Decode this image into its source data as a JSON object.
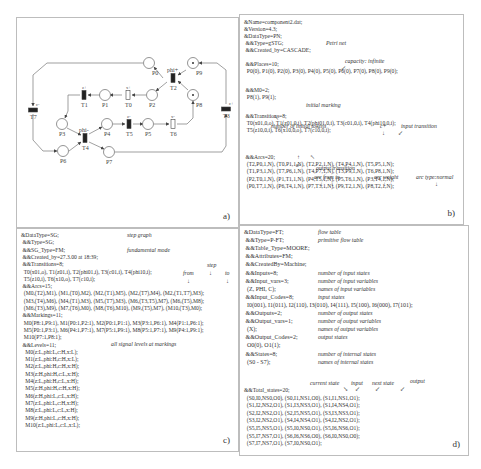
{
  "panels": {
    "a": {
      "label": "a)",
      "places": [
        {
          "id": "P0",
          "tokens": 0
        },
        {
          "id": "P1",
          "tokens": 0
        },
        {
          "id": "P2",
          "tokens": 0
        },
        {
          "id": "P3",
          "tokens": 0
        },
        {
          "id": "P4",
          "tokens": 0
        },
        {
          "id": "P5",
          "tokens": 0
        },
        {
          "id": "P6",
          "tokens": 0
        },
        {
          "id": "P7",
          "tokens": 0
        },
        {
          "id": "P8",
          "tokens": 1
        },
        {
          "id": "P9",
          "tokens": 1
        }
      ],
      "transitions": [
        {
          "id": "T0",
          "signal": "x+",
          "kind": "output"
        },
        {
          "id": "T1",
          "signal": "z+",
          "kind": "input"
        },
        {
          "id": "T2",
          "signal": "phi+",
          "kind": "input"
        },
        {
          "id": "T3",
          "signal": "c+",
          "kind": "input"
        },
        {
          "id": "T4",
          "signal": "phi-",
          "kind": "input"
        },
        {
          "id": "T5",
          "signal": "z-",
          "kind": "input"
        },
        {
          "id": "T6",
          "signal": "x-",
          "kind": "output"
        },
        {
          "id": "T7",
          "signal": "c-",
          "kind": "input"
        }
      ]
    },
    "b": {
      "label": "b)",
      "lines": [
        "&Name=component2.dat;",
        "&Version=4.3;",
        "&DataType=PN;",
        " &&Type=gSTG;",
        " &&Created_by=CASCADE;",
        " &&Places=10;",
        "  P0(0), P1(0), P2(0), P3(0), P4(0), P5(0), P6(0), P7(0), P8(0), P9(0);",
        " &&M0=2;",
        "  P8(1), P9(1);",
        " &&Transitions=8;",
        "  T0(x01,0,o), T1(z01,0,i), T2(phi01,0,i), T3(c01,0,i), T4(phi10,0,i);",
        "  T5(z10,0,i), T6(x10,0,o), T7(c10,0,i);",
        " &&Arcs=20;",
        "  (T2,P0,1,N), (T0,P1,1,N), (T2,P2,1,N), (T4,P4,1,N), (T5,P5,1,N);",
        "  (T1,P3,1,N), (T7,P6,1,N), (T4,P7,1,N), (T3,P9,1,N), (T6,P8,1,N);",
        "  (P2,T0,1,N), (P1,T1,1,N), (P4,T5,1,N), (P5,T6,1,N), (P3,T4,1,N);",
        "  (P0,T7,1,N), (P6,T4,1,N), (P7,T3,1,N), (P9,T2,1,N), (P8,T2,1,N);"
      ],
      "annotations": {
        "petri_net": "Petri net",
        "capacity": "capacity: infinite",
        "initial_marking": "initial marking",
        "initial_tokens": "number of initial tokens",
        "c_plus": "c+",
        "input_transition": "input transition",
        "x_minus": "x-",
        "output_transition": "output transition",
        "arc_from_to": "arc from to",
        "arc_weight": "arc weight",
        "arc_type": "arc type:normal"
      }
    },
    "c": {
      "label": "c)",
      "lines": [
        "&DataType=SG;",
        " &&Type=SG;",
        " &&SG_Type=FM;",
        " &&Created_by=27.3.00 at 18:39;",
        " &&Transitions=8;",
        "  T0(x01,o), T1(z01,i), T2(phi01,i), T3(c01,i), T4(phi10,i);",
        "  T5(z10,i), T6(x10,o), T7(c10,i);",
        " &&Arcs=15;",
        "  (M0,(T2),M1), (M1,(T0),M2), (M2,(T1),M5), (M2,(T7),M4), (M2,(T1,T7),M3);",
        "  (M3,(T4),M6), (M4,(T1),M3), (M5,(T7),M3), (M6,(T3,T5),M7), (M6,(T5),M8);",
        "  (M6,(T3),M9), (M7,(T6),M0), (M8,(T6),M10), (M9,(T5),M7), (M10,(T3),M0);",
        " &&Markings=11;",
        "  M0(P8:1,P9:1), M1(P0:1,P2:1), M2(P0:1,P1:1), M3(P3:1,P6:1), M4(P1:1,P6:1);",
        "  M5(P0:1,P3:1), M6(P4:1,P7:1), M7(P5:1,P9:1), M8(P5:1,P7:1), M9(P4:1,P9:1);",
        "  M10(P7:1,P8:1);",
        " &&Levels=11;",
        "   M0(z:L,phi:L,c:H,x:L);",
        "   M1(z:L,phi:H,c:H,x:L);",
        "   M2(z:L,phi:H,c:H,x:H);",
        "   M3(z:H,phi:H,c:L,x:H);",
        "   M4(z:L,phi:H,c:L,x:H);",
        "   M5(z:H,phi:H,c:H,x:H);",
        "   M6(z:H,phi:L,c:L,x:H);",
        "   M7(z:L,phi:L,c:H,x:H);",
        "   M8(z:L,phi:L,c:L,x:H);",
        "   M9(z:H,phi:L,c:H,x:H);",
        "   M10(z:L,phi:L,c:L,x:L);"
      ],
      "annotations": {
        "step_graph": "step graph",
        "fundamental_mode": "fundamental mode",
        "step": "step",
        "from": "from",
        "to": "to",
        "signal_levels": "all signal levels at markings"
      }
    },
    "d": {
      "label": "d)",
      "rows": [
        {
          "code": "&DataType=FT;",
          "note": "flow table"
        },
        {
          "code": " &&Type=P-FT;",
          "note": "primitive flow table"
        },
        {
          "code": " &&Table_Type=MOORE;",
          "note": ""
        },
        {
          "code": " &&Attributes=FM;",
          "note": ""
        },
        {
          "code": " &&CreatedBy=Machine;",
          "note": ""
        },
        {
          "code": " &&Inputs=8;",
          "note": "number of input states"
        },
        {
          "code": " &&Input_vars=3;",
          "note": "number of input variables"
        },
        {
          "code": "  (Z, PHI, C);",
          "note": "names of input variables"
        },
        {
          "code": " &&Input_Codes=8;",
          "note": "input states"
        },
        {
          "code": "  I0(001), I1(011), I2(110), I3(010), I4(111), I5(100), I6(000), I7(101);",
          "note": ""
        },
        {
          "code": " &&Outputs=2;",
          "note": "number of output states"
        },
        {
          "code": " &&Output_vars=1;",
          "note": "number of output variables"
        },
        {
          "code": "  (X);",
          "note": "names of output variables"
        },
        {
          "code": " &&Output_Codes=2;",
          "note": "output states"
        },
        {
          "code": "  O0(0), O1(1);",
          "note": ""
        },
        {
          "code": " &&States=8;",
          "note": "number of internal states"
        },
        {
          "code": "  (S0 - S7);",
          "note": "names  of internal states"
        }
      ],
      "total_lines": [
        "&&Total_states=20;",
        "  (S0,I0,NS0,O0), (S0,I1,NS1,O0), (S1,I1,NS1,O1);",
        "  (S1,I2,NS2,O1), (S1,I3,NS3,O1), (S1,I4,NS4,O1);",
        "  (S2,I2,NS2,O1), (S2,I5,NS5,O1), (S3,I3,NS3,O1);",
        "  (S3,I2,NS2,O1), (S4,I4,NS4,O1), (S4,I2,NS2,O1);",
        "  (S5,I5,NS5,O1), (S5,I0,NS0,O1), (S5,I6,NS6,O1);",
        "  (S5,I7,NS7,O1), (S6,I6,NS6,O0), (S6,I0,NS0,O0);",
        "  (S7,I7,NS7,O1), (S7,I0,NS0,O1);"
      ],
      "annotations": {
        "current_state": "current state",
        "input": "input",
        "next_state": "next state",
        "output": "output"
      }
    }
  }
}
